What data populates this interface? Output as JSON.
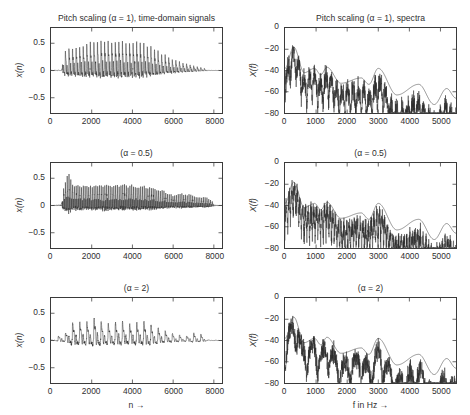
{
  "figure": {
    "width": 470,
    "height": 415,
    "background": "#ffffff",
    "line_color": "#2b2b2b"
  },
  "subplots": [
    {
      "name": "time-domain-alpha-1",
      "title": "Pitch scaling (α = 1), time-domain signals",
      "ylabel": "x(n)",
      "xlabel": "",
      "yticks": [
        "0.5",
        "0",
        "−0.5"
      ],
      "ytick_values": [
        0.5,
        0,
        -0.5
      ],
      "xticks": [
        "0",
        "2000",
        "4000",
        "6000",
        "8000"
      ],
      "xtick_values": [
        0,
        2000,
        4000,
        6000,
        8000
      ]
    },
    {
      "name": "spectra-alpha-1",
      "title": "Pitch scaling (α = 1), spectra",
      "ylabel": "X(f)",
      "xlabel": "",
      "yticks": [
        "0",
        "−20",
        "−40",
        "−60",
        "−80"
      ],
      "ytick_values": [
        0,
        -20,
        -40,
        -60,
        -80
      ],
      "xticks": [
        "0",
        "1000",
        "2000",
        "3000",
        "4000",
        "5000"
      ],
      "xtick_values": [
        0,
        1000,
        2000,
        3000,
        4000,
        5000
      ]
    },
    {
      "name": "time-domain-alpha-0-5",
      "title": "(α = 0.5)",
      "ylabel": "x(n)",
      "xlabel": "",
      "yticks": [
        "0.5",
        "0",
        "−0.5"
      ],
      "ytick_values": [
        0.5,
        0,
        -0.5
      ],
      "xticks": [
        "0",
        "2000",
        "4000",
        "6000",
        "8000"
      ],
      "xtick_values": [
        0,
        2000,
        4000,
        6000,
        8000
      ]
    },
    {
      "name": "spectra-alpha-0-5",
      "title": "(α = 0.5)",
      "ylabel": "X(f)",
      "xlabel": "",
      "yticks": [
        "0",
        "−20",
        "−40",
        "−60",
        "−80"
      ],
      "ytick_values": [
        0,
        -20,
        -40,
        -60,
        -80
      ],
      "xticks": [
        "0",
        "1000",
        "2000",
        "3000",
        "4000",
        "5000"
      ],
      "xtick_values": [
        0,
        1000,
        2000,
        3000,
        4000,
        5000
      ]
    },
    {
      "name": "time-domain-alpha-2",
      "title": "(α = 2)",
      "ylabel": "x(n)",
      "xlabel": "n →",
      "yticks": [
        "0.5",
        "0",
        "−0.5"
      ],
      "ytick_values": [
        0.5,
        0,
        -0.5
      ],
      "xticks": [
        "0",
        "2000",
        "4000",
        "6000",
        "8000"
      ],
      "xtick_values": [
        0,
        2000,
        4000,
        6000,
        8000
      ]
    },
    {
      "name": "spectra-alpha-2",
      "title": "(α = 2)",
      "ylabel": "X(f)",
      "xlabel": "f in Hz →",
      "yticks": [
        "0",
        "−20",
        "−40",
        "−60",
        "−80"
      ],
      "ytick_values": [
        0,
        -20,
        -40,
        -60,
        -80
      ],
      "xticks": [
        "0",
        "1000",
        "2000",
        "3000",
        "4000",
        "5000"
      ],
      "xtick_values": [
        0,
        1000,
        2000,
        3000,
        4000,
        5000
      ]
    }
  ],
  "chart_data": [
    {
      "type": "line",
      "name": "time-domain-alpha-1",
      "title": "Pitch scaling (α = 1), time-domain signals",
      "xlabel": "n",
      "ylabel": "x(n)",
      "xlim": [
        0,
        8400
      ],
      "ylim": [
        -0.78,
        0.78
      ],
      "grid": false,
      "legend": null,
      "description": "Amplitude-modulated voiced speech burst; pitch period about 175 samples, envelope rises from n=600, peaks near n=2300-4500 at |x| = 0.45, decays to near zero by n=7600.",
      "signal": {
        "kind": "pulse-train",
        "period": 175,
        "start": 560,
        "end": 7700,
        "peak": 0.45,
        "envelope_points": [
          [
            0,
            0.02
          ],
          [
            500,
            0.04
          ],
          [
            650,
            0.3
          ],
          [
            900,
            0.33
          ],
          [
            1200,
            0.34
          ],
          [
            1600,
            0.38
          ],
          [
            2000,
            0.42
          ],
          [
            2300,
            0.45
          ],
          [
            2800,
            0.43
          ],
          [
            3200,
            0.44
          ],
          [
            3700,
            0.42
          ],
          [
            4200,
            0.43
          ],
          [
            4600,
            0.4
          ],
          [
            5000,
            0.33
          ],
          [
            5400,
            0.26
          ],
          [
            5900,
            0.18
          ],
          [
            6400,
            0.12
          ],
          [
            6900,
            0.08
          ],
          [
            7300,
            0.05
          ],
          [
            7700,
            0.02
          ],
          [
            8000,
            0.01
          ],
          [
            8400,
            0.01
          ]
        ]
      }
    },
    {
      "type": "line",
      "name": "spectra-alpha-1",
      "title": "Pitch scaling (α = 1), spectra",
      "xlabel": "f in Hz",
      "ylabel": "X(f)",
      "xlim": [
        0,
        5500
      ],
      "ylim": [
        -80,
        0
      ],
      "grid": false,
      "legend": null,
      "description": "Two overlaid magnitude spectra in dB. Smooth spectral envelope peaks near -18 dB at 280 Hz with formant bumps at ~950, ~1350, ~2450, ~3000 Hz, decaying to about -70 dB at 5500 Hz; a second jagged harmonic spectrum oscillates below it.",
      "series": [
        {
          "name": "envelope",
          "peaks_hz": [
            280,
            950,
            1350,
            2450,
            3000,
            4300,
            5200
          ],
          "peak_db": [
            -18,
            -38,
            -37,
            -47,
            -38,
            -53,
            -57
          ],
          "valleys_hz": [
            620,
            1150,
            1800,
            2700,
            3600,
            4800
          ],
          "valley_db": [
            -42,
            -44,
            -52,
            -53,
            -63,
            -72
          ]
        },
        {
          "name": "harmonic",
          "noise_floor_db": -80,
          "top_db": -20,
          "ripple_hz": 175
        }
      ]
    },
    {
      "type": "line",
      "name": "time-domain-alpha-0-5",
      "title": "(α = 0.5)",
      "xlabel": "n",
      "ylabel": "x(n)",
      "xlim": [
        0,
        8400
      ],
      "ylim": [
        -0.78,
        0.78
      ],
      "grid": false,
      "legend": null,
      "description": "Pitch halved: pulse period about 88 samples, denser oscillation spanning n=550 to n=8000, peak |x| near 0.48 at n=880 then a broad plateau near 0.30.",
      "signal": {
        "kind": "pulse-train",
        "period": 88,
        "start": 550,
        "end": 8000,
        "peak": 0.48,
        "envelope_points": [
          [
            0,
            0.02
          ],
          [
            450,
            0.05
          ],
          [
            600,
            0.28
          ],
          [
            880,
            0.48
          ],
          [
            1100,
            0.32
          ],
          [
            1500,
            0.3
          ],
          [
            2000,
            0.3
          ],
          [
            2500,
            0.31
          ],
          [
            3000,
            0.3
          ],
          [
            3500,
            0.31
          ],
          [
            4000,
            0.3
          ],
          [
            4500,
            0.29
          ],
          [
            5000,
            0.27
          ],
          [
            5500,
            0.22
          ],
          [
            6000,
            0.15
          ],
          [
            6400,
            0.18
          ],
          [
            6800,
            0.16
          ],
          [
            7200,
            0.12
          ],
          [
            7600,
            0.13
          ],
          [
            8000,
            0.05
          ],
          [
            8400,
            0.01
          ]
        ]
      }
    },
    {
      "type": "line",
      "name": "spectra-alpha-0-5",
      "title": "(α = 0.5)",
      "xlabel": "f in Hz",
      "ylabel": "X(f)",
      "xlim": [
        0,
        5500
      ],
      "ylim": [
        -80,
        0
      ],
      "grid": false,
      "legend": null,
      "description": "Same envelope peaking at -18 dB near 280 Hz; overlaid harmonic spectrum has denser ripple (half the pitch spacing) and falls below -70 dB beyond 4000 Hz.",
      "series": [
        {
          "name": "envelope",
          "peaks_hz": [
            280,
            950,
            1350,
            2450,
            3000,
            4300,
            5200
          ],
          "peak_db": [
            -18,
            -38,
            -37,
            -47,
            -38,
            -53,
            -57
          ],
          "valleys_hz": [
            620,
            1150,
            1800,
            2700,
            3600,
            4800
          ],
          "valley_db": [
            -42,
            -44,
            -52,
            -53,
            -63,
            -72
          ]
        },
        {
          "name": "harmonic",
          "noise_floor_db": -80,
          "top_db": -20,
          "ripple_hz": 88
        }
      ]
    },
    {
      "type": "line",
      "name": "time-domain-alpha-2",
      "title": "(α = 2)",
      "xlabel": "n →",
      "ylabel": "x(n)",
      "xlim": [
        0,
        8400
      ],
      "ylim": [
        -0.78,
        0.78
      ],
      "grid": false,
      "legend": null,
      "description": "Pitch doubled: sparse glottal pulses spaced about 350 samples, individual spikes reaching 0.38 between n=1000 and n=5500, tapering to small bursts near n=7200.",
      "signal": {
        "kind": "pulse-train",
        "period": 350,
        "start": 300,
        "end": 7600,
        "peak": 0.38,
        "envelope_points": [
          [
            0,
            0.02
          ],
          [
            300,
            0.06
          ],
          [
            700,
            0.1
          ],
          [
            1000,
            0.26
          ],
          [
            1400,
            0.28
          ],
          [
            1800,
            0.27
          ],
          [
            2200,
            0.36
          ],
          [
            2600,
            0.26
          ],
          [
            3000,
            0.25
          ],
          [
            3400,
            0.3
          ],
          [
            3800,
            0.24
          ],
          [
            4200,
            0.27
          ],
          [
            4600,
            0.3
          ],
          [
            5000,
            0.22
          ],
          [
            5400,
            0.18
          ],
          [
            5800,
            0.12
          ],
          [
            6200,
            0.09
          ],
          [
            6600,
            0.06
          ],
          [
            7000,
            0.11
          ],
          [
            7400,
            0.09
          ],
          [
            7800,
            0.03
          ],
          [
            8400,
            0.01
          ]
        ]
      }
    },
    {
      "type": "line",
      "name": "spectra-alpha-2",
      "title": "(α = 2)",
      "xlabel": "f in Hz →",
      "ylabel": "X(f)",
      "xlim": [
        0,
        5500
      ],
      "ylim": [
        -80,
        0
      ],
      "grid": false,
      "legend": null,
      "description": "Same smooth envelope peaking at -18 dB near 280 Hz; overlaid harmonic spectrum is very dense and noisy, hugging -60 to -80 dB above 3500 Hz.",
      "series": [
        {
          "name": "envelope",
          "peaks_hz": [
            280,
            950,
            1350,
            2450,
            3000,
            4300,
            5200
          ],
          "peak_db": [
            -18,
            -38,
            -37,
            -47,
            -38,
            -53,
            -57
          ],
          "valleys_hz": [
            620,
            1150,
            1800,
            2700,
            3600,
            4800
          ],
          "valley_db": [
            -42,
            -44,
            -52,
            -53,
            -63,
            -72
          ]
        },
        {
          "name": "harmonic",
          "noise_floor_db": -80,
          "top_db": -20,
          "ripple_hz": 350
        }
      ]
    }
  ]
}
